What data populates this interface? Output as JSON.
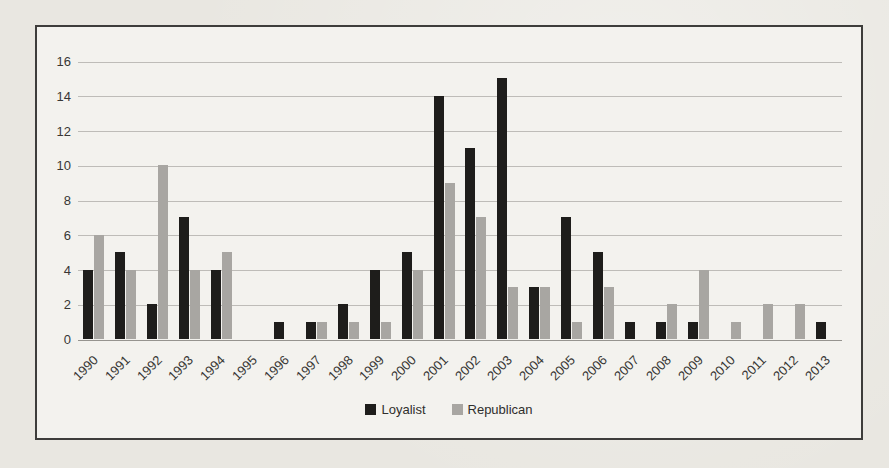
{
  "chart_data": {
    "type": "bar",
    "categories": [
      "1990",
      "1991",
      "1992",
      "1993",
      "1994",
      "1995",
      "1996",
      "1997",
      "1998",
      "1999",
      "2000",
      "2001",
      "2002",
      "2003",
      "2004",
      "2005",
      "2006",
      "2007",
      "2008",
      "2009",
      "2010",
      "2011",
      "2012",
      "2013"
    ],
    "series": [
      {
        "name": "Loyalist",
        "color": "#1e1d1b",
        "values": [
          4,
          5,
          2,
          7,
          4,
          0,
          1,
          1,
          2,
          4,
          5,
          14,
          11,
          15,
          3,
          7,
          5,
          1,
          1,
          1,
          0,
          0,
          0,
          1
        ]
      },
      {
        "name": "Republican",
        "color": "#a8a6a2",
        "values": [
          6,
          4,
          10,
          4,
          5,
          0,
          0,
          1,
          1,
          1,
          4,
          9,
          7,
          3,
          3,
          1,
          3,
          0,
          2,
          4,
          1,
          2,
          2,
          0
        ]
      }
    ],
    "title": "",
    "xlabel": "",
    "ylabel": "",
    "ylim": [
      0,
      16
    ],
    "yticks": [
      0,
      2,
      4,
      6,
      8,
      10,
      12,
      14,
      16
    ],
    "grid": "horizontal",
    "legend_position": "bottom"
  },
  "legend": {
    "items": [
      {
        "label": "Loyalist",
        "color": "#1e1d1b"
      },
      {
        "label": "Republican",
        "color": "#a8a6a2"
      }
    ]
  },
  "colors": {
    "page_background": "#e9e7e1",
    "frame_background": "#f3f2ee",
    "frame_border": "#3e3d3b",
    "gridline": "#bebcb8",
    "axis_line": "#96948f",
    "text": "#383735"
  }
}
